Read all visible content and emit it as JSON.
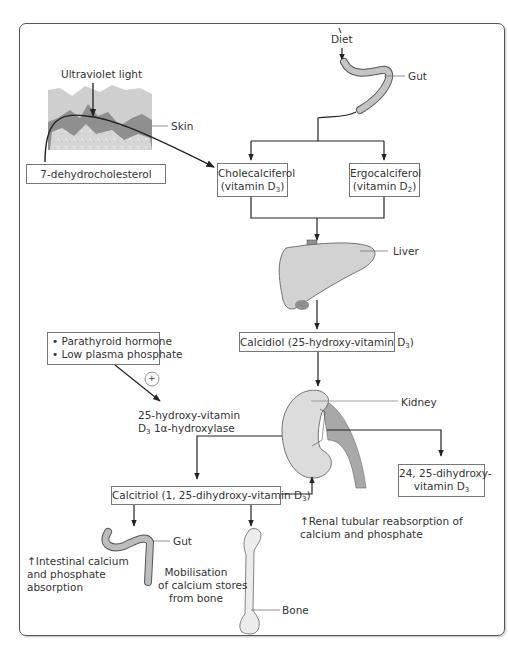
{
  "diagram": {
    "sources": {
      "uv_light": "Ultraviolet light",
      "skin": "Skin",
      "diet": "Diet",
      "gut_top": "Gut",
      "precursor": "7-dehydrocholesterol"
    },
    "forms": {
      "d3_name": "Cholecalciferol",
      "d3_sub": "(vitamin D",
      "d3_subscript": "3",
      "d2_name": "Ergocalciferol",
      "d2_sub": "(vitamin D",
      "d2_subscript": "2"
    },
    "liver": {
      "label": "Liver",
      "product": "Calcidiol (25-hydroxy-vitamin D",
      "product_subscript": "3"
    },
    "regulation": {
      "item1": "• Parathyroid hormone",
      "item2": "• Low plasma phosphate",
      "sign": "+",
      "enzyme_line1": "25-hydroxy-vitamin",
      "enzyme_line2_pre": "D",
      "enzyme_line2_sub": "3",
      "enzyme_line2_post": " 1α-hydroxylase"
    },
    "kidney": {
      "label": "Kidney",
      "inactive_line1": "24, 25-dihydroxy-",
      "inactive_line2": "vitamin D",
      "inactive_subscript": "3",
      "product": "Calcitriol (1, 25-dihydroxy-vitamin D",
      "product_subscript": "3"
    },
    "effects": {
      "gut_label": "Gut",
      "intestinal_line1": "↑Intestinal calcium",
      "intestinal_line2": "and phosphate",
      "intestinal_line3": "absorption",
      "bone_line1": "Mobilisation",
      "bone_line2": "of calcium stores",
      "bone_line3": "from bone",
      "bone_label": "Bone",
      "renal_line1": "↑Renal tubular reabsorption of",
      "renal_line2": "calcium and phosphate"
    }
  }
}
